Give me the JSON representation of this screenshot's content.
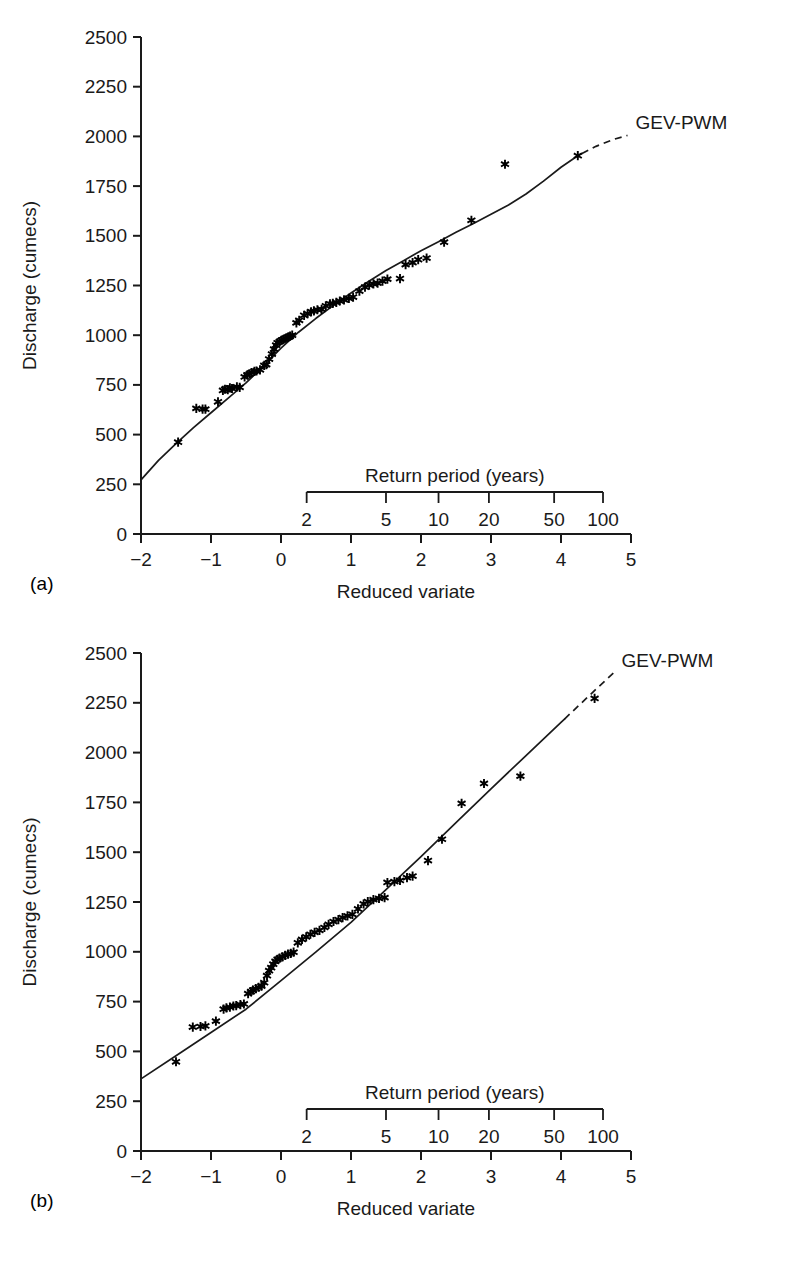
{
  "figure": {
    "panels": [
      {
        "tag": "(a)",
        "series_label": "GEV-PWM"
      },
      {
        "tag": "(b)",
        "series_label": "GEV-PWM"
      }
    ],
    "axis_titles": {
      "y": "Discharge (cumecs)",
      "x": "Reduced variate",
      "secondary_x": "Return period (years)"
    }
  },
  "chart_data": [
    {
      "type": "scatter",
      "title": "",
      "panel": "(a)",
      "xlabel": "Reduced variate",
      "ylabel": "Discharge (cumecs)",
      "xlim": [
        -2,
        5
      ],
      "ylim": [
        0,
        2500
      ],
      "xticks": [
        -2,
        -1,
        0,
        1,
        2,
        3,
        4,
        5
      ],
      "xticklabels": [
        "−2",
        "−1",
        "0",
        "1",
        "2",
        "3",
        "4",
        "5"
      ],
      "yticks": [
        0,
        250,
        500,
        750,
        1000,
        1250,
        1500,
        1750,
        2000,
        2250,
        2500
      ],
      "yticklabels": [
        "0",
        "250",
        "500",
        "750",
        "1000",
        "1250",
        "1500",
        "1750",
        "2000",
        "2250",
        "2500"
      ],
      "grid": false,
      "legend": [
        "GEV-PWM"
      ],
      "legend_position": "upper-right-inline",
      "secondary_axis": {
        "label": "Return period (years)",
        "ticks": [
          2,
          5,
          10,
          20,
          50,
          100
        ],
        "ticklabels": [
          "2",
          "5",
          "10",
          "20",
          "50",
          "100"
        ],
        "reduced_variate_positions": [
          0.3665,
          1.4999,
          2.2504,
          2.9702,
          3.9019,
          4.6001
        ]
      },
      "marker": "asterisk",
      "points": [
        [
          -1.47,
          462
        ],
        [
          -1.21,
          632
        ],
        [
          -1.12,
          628
        ],
        [
          -1.08,
          628
        ],
        [
          -0.9,
          665
        ],
        [
          -0.83,
          722
        ],
        [
          -0.8,
          728
        ],
        [
          -0.76,
          726
        ],
        [
          -0.73,
          735
        ],
        [
          -0.7,
          732
        ],
        [
          -0.63,
          740
        ],
        [
          -0.59,
          738
        ],
        [
          -0.52,
          790
        ],
        [
          -0.48,
          800
        ],
        [
          -0.45,
          805
        ],
        [
          -0.42,
          812
        ],
        [
          -0.38,
          818
        ],
        [
          -0.35,
          820
        ],
        [
          -0.3,
          826
        ],
        [
          -0.24,
          848
        ],
        [
          -0.21,
          852
        ],
        [
          -0.17,
          880
        ],
        [
          -0.13,
          905
        ],
        [
          -0.1,
          930
        ],
        [
          -0.07,
          950
        ],
        [
          -0.05,
          962
        ],
        [
          -0.02,
          968
        ],
        [
          0.01,
          975
        ],
        [
          0.04,
          980
        ],
        [
          0.07,
          985
        ],
        [
          0.1,
          990
        ],
        [
          0.13,
          995
        ],
        [
          0.16,
          1000
        ],
        [
          0.22,
          1062
        ],
        [
          0.26,
          1075
        ],
        [
          0.33,
          1100
        ],
        [
          0.38,
          1108
        ],
        [
          0.43,
          1118
        ],
        [
          0.47,
          1122
        ],
        [
          0.52,
          1128
        ],
        [
          0.58,
          1130
        ],
        [
          0.64,
          1148
        ],
        [
          0.7,
          1158
        ],
        [
          0.74,
          1160
        ],
        [
          0.79,
          1165
        ],
        [
          0.84,
          1172
        ],
        [
          0.9,
          1178
        ],
        [
          0.97,
          1185
        ],
        [
          1.03,
          1192
        ],
        [
          1.12,
          1222
        ],
        [
          1.2,
          1242
        ],
        [
          1.26,
          1252
        ],
        [
          1.32,
          1258
        ],
        [
          1.38,
          1262
        ],
        [
          1.45,
          1272
        ],
        [
          1.52,
          1282
        ],
        [
          1.7,
          1285
        ],
        [
          1.78,
          1355
        ],
        [
          1.88,
          1365
        ],
        [
          1.96,
          1380
        ],
        [
          2.08,
          1388
        ],
        [
          2.33,
          1468
        ],
        [
          2.72,
          1578
        ],
        [
          3.2,
          1860
        ],
        [
          4.24,
          1903
        ]
      ],
      "fit_curve": {
        "name": "GEV-PWM",
        "style": "solid-with-dashed-extension",
        "solid_x_range": [
          -2.0,
          4.3
        ],
        "dashed_x_range": [
          4.3,
          4.95
        ],
        "points": [
          [
            -2.0,
            272
          ],
          [
            -1.75,
            370
          ],
          [
            -1.5,
            455
          ],
          [
            -1.25,
            535
          ],
          [
            -1.0,
            610
          ],
          [
            -0.75,
            685
          ],
          [
            -0.5,
            760
          ],
          [
            -0.25,
            845
          ],
          [
            0.0,
            935
          ],
          [
            0.25,
            1015
          ],
          [
            0.5,
            1085
          ],
          [
            0.75,
            1150
          ],
          [
            1.0,
            1212
          ],
          [
            1.25,
            1270
          ],
          [
            1.5,
            1325
          ],
          [
            1.75,
            1375
          ],
          [
            2.0,
            1425
          ],
          [
            2.25,
            1470
          ],
          [
            2.5,
            1518
          ],
          [
            2.75,
            1562
          ],
          [
            3.0,
            1608
          ],
          [
            3.25,
            1655
          ],
          [
            3.5,
            1710
          ],
          [
            3.75,
            1775
          ],
          [
            4.0,
            1845
          ],
          [
            4.25,
            1905
          ],
          [
            4.5,
            1950
          ],
          [
            4.75,
            1985
          ],
          [
            4.95,
            2005
          ]
        ]
      }
    },
    {
      "type": "scatter",
      "title": "",
      "panel": "(b)",
      "xlabel": "Reduced variate",
      "ylabel": "Discharge (cumecs)",
      "xlim": [
        -2,
        5
      ],
      "ylim": [
        0,
        2500
      ],
      "xticks": [
        -2,
        -1,
        0,
        1,
        2,
        3,
        4,
        5
      ],
      "xticklabels": [
        "−2",
        "−1",
        "0",
        "1",
        "2",
        "3",
        "4",
        "5"
      ],
      "yticks": [
        0,
        250,
        500,
        750,
        1000,
        1250,
        1500,
        1750,
        2000,
        2250,
        2500
      ],
      "yticklabels": [
        "0",
        "250",
        "500",
        "750",
        "1000",
        "1250",
        "1500",
        "1750",
        "2000",
        "2250",
        "2500"
      ],
      "grid": false,
      "legend": [
        "GEV-PWM"
      ],
      "legend_position": "upper-right-inline",
      "secondary_axis": {
        "label": "Return period (years)",
        "ticks": [
          2,
          5,
          10,
          20,
          50,
          100
        ],
        "ticklabels": [
          "2",
          "5",
          "10",
          "20",
          "50",
          "100"
        ],
        "reduced_variate_positions": [
          0.3665,
          1.4999,
          2.2504,
          2.9702,
          3.9019,
          4.6001
        ]
      },
      "marker": "asterisk",
      "points": [
        [
          -1.5,
          448
        ],
        [
          -1.26,
          622
        ],
        [
          -1.15,
          625
        ],
        [
          -1.08,
          628
        ],
        [
          -0.93,
          652
        ],
        [
          -0.82,
          712
        ],
        [
          -0.78,
          718
        ],
        [
          -0.73,
          722
        ],
        [
          -0.68,
          728
        ],
        [
          -0.64,
          730
        ],
        [
          -0.58,
          735
        ],
        [
          -0.53,
          738
        ],
        [
          -0.47,
          790
        ],
        [
          -0.43,
          800
        ],
        [
          -0.4,
          808
        ],
        [
          -0.36,
          815
        ],
        [
          -0.32,
          822
        ],
        [
          -0.28,
          828
        ],
        [
          -0.24,
          845
        ],
        [
          -0.2,
          880
        ],
        [
          -0.17,
          905
        ],
        [
          -0.14,
          920
        ],
        [
          -0.11,
          938
        ],
        [
          -0.08,
          952
        ],
        [
          -0.05,
          962
        ],
        [
          -0.02,
          968
        ],
        [
          0.02,
          975
        ],
        [
          0.06,
          982
        ],
        [
          0.1,
          988
        ],
        [
          0.14,
          992
        ],
        [
          0.18,
          998
        ],
        [
          0.24,
          1045
        ],
        [
          0.3,
          1062
        ],
        [
          0.36,
          1075
        ],
        [
          0.42,
          1088
        ],
        [
          0.48,
          1098
        ],
        [
          0.55,
          1108
        ],
        [
          0.62,
          1122
        ],
        [
          0.68,
          1138
        ],
        [
          0.75,
          1152
        ],
        [
          0.82,
          1162
        ],
        [
          0.88,
          1172
        ],
        [
          0.95,
          1180
        ],
        [
          1.02,
          1188
        ],
        [
          1.1,
          1215
        ],
        [
          1.18,
          1240
        ],
        [
          1.24,
          1252
        ],
        [
          1.32,
          1262
        ],
        [
          1.4,
          1268
        ],
        [
          1.48,
          1272
        ],
        [
          1.52,
          1348
        ],
        [
          1.62,
          1352
        ],
        [
          1.7,
          1358
        ],
        [
          1.8,
          1372
        ],
        [
          1.88,
          1380
        ],
        [
          2.1,
          1458
        ],
        [
          2.3,
          1565
        ],
        [
          2.58,
          1745
        ],
        [
          2.9,
          1845
        ],
        [
          3.42,
          1882
        ],
        [
          4.48,
          2272
        ]
      ],
      "fit_curve": {
        "name": "GEV-PWM",
        "style": "solid-with-dashed-extension",
        "solid_x_range": [
          -2.0,
          4.05
        ],
        "dashed_x_range": [
          4.05,
          4.75
        ],
        "points": [
          [
            -2.0,
            362
          ],
          [
            -1.5,
            478
          ],
          [
            -1.0,
            595
          ],
          [
            -0.5,
            712
          ],
          [
            0.0,
            855
          ],
          [
            0.5,
            1000
          ],
          [
            1.0,
            1148
          ],
          [
            1.5,
            1312
          ],
          [
            2.0,
            1478
          ],
          [
            2.5,
            1648
          ],
          [
            3.0,
            1818
          ],
          [
            3.5,
            1985
          ],
          [
            4.0,
            2152
          ],
          [
            4.5,
            2318
          ],
          [
            4.75,
            2400
          ]
        ]
      }
    }
  ]
}
